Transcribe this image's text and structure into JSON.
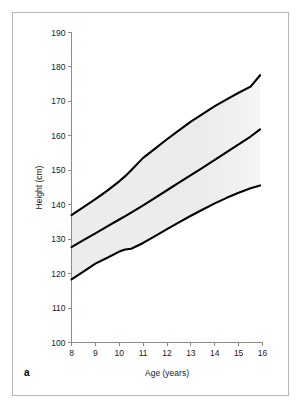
{
  "figure": {
    "panel_label": "a",
    "border_color": "#b9b9b9",
    "background": "#ffffff"
  },
  "chart_data": {
    "type": "line",
    "title": "",
    "xlabel": "Age (years)",
    "ylabel": "Height (cm)",
    "xlim": [
      8,
      16
    ],
    "ylim": [
      100,
      190
    ],
    "xticks": [
      8,
      9,
      10,
      11,
      12,
      13,
      14,
      15,
      16
    ],
    "yticks": [
      100,
      110,
      120,
      130,
      140,
      150,
      160,
      170,
      180,
      190
    ],
    "xtick_labels": [
      "8",
      "9",
      "10",
      "11",
      "12",
      "13",
      "14",
      "15",
      "16"
    ],
    "ytick_labels": [
      "100",
      "110",
      "120",
      "130",
      "140",
      "150",
      "160",
      "170",
      "180",
      "190"
    ],
    "grid": false,
    "legend": null,
    "band_color": "#ececec",
    "curve_color": "#000000",
    "x": [
      8,
      8.5,
      9,
      9.5,
      10,
      10.25,
      10.5,
      11,
      11.5,
      12,
      12.5,
      13,
      13.5,
      14,
      14.5,
      15,
      15.5,
      15.9
    ],
    "series": [
      {
        "name": "Upper centile",
        "values": [
          137.0,
          139.3,
          141.6,
          144.1,
          146.8,
          148.3,
          150.0,
          153.6,
          156.3,
          159.0,
          161.6,
          164.1,
          166.4,
          168.6,
          170.6,
          172.5,
          174.3,
          177.6
        ]
      },
      {
        "name": "Median",
        "values": [
          127.7,
          129.7,
          131.7,
          133.7,
          135.7,
          136.7,
          137.7,
          139.8,
          142.0,
          144.2,
          146.4,
          148.6,
          150.8,
          153.0,
          155.3,
          157.5,
          159.8,
          161.9
        ]
      },
      {
        "name": "Lower centile",
        "values": [
          118.3,
          120.6,
          122.9,
          124.6,
          126.4,
          127.0,
          127.2,
          128.9,
          130.9,
          132.9,
          134.9,
          136.8,
          138.6,
          140.4,
          142.0,
          143.5,
          144.8,
          145.6
        ]
      }
    ],
    "shaded_band": {
      "description": "Grey reference band spanning between lower and upper centile curves, fading at the right edge",
      "upper_series": "Upper centile",
      "lower_series": "Lower centile"
    }
  }
}
